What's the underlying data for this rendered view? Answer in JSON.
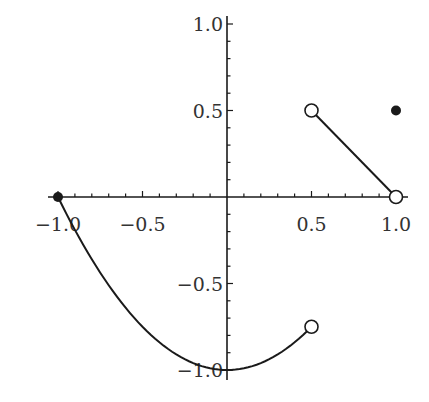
{
  "chart_data": {
    "type": "line",
    "title": "",
    "xlabel": "",
    "ylabel": "",
    "xlim": [
      -1.0,
      1.0
    ],
    "ylim": [
      -1.0,
      1.0
    ],
    "grid": false,
    "legend": null,
    "x_ticks": [
      -1.0,
      -0.5,
      0.5,
      1.0
    ],
    "x_tick_labels": [
      "−1.0",
      "−0.5",
      "0.5",
      "1.0"
    ],
    "y_ticks": [
      1.0,
      0.5,
      -0.5,
      -1.0
    ],
    "y_tick_labels": [
      "1.0",
      "0.5",
      "−0.5",
      "−1.0"
    ],
    "minor_tick_step": 0.1,
    "series": [
      {
        "name": "piece-1 (curve)",
        "description": "y = x^2 - 1 on [-1, 0.5)",
        "x": [
          -1.0,
          -0.75,
          -0.5,
          -0.25,
          0.0,
          0.25,
          0.5
        ],
        "y": [
          0.0,
          -0.4375,
          -0.75,
          -0.9375,
          -1.0,
          -0.9375,
          -0.75
        ]
      },
      {
        "name": "piece-2 (line)",
        "description": "line from (0.5, 0.5) to (1, 0)",
        "x": [
          0.5,
          1.0
        ],
        "y": [
          0.5,
          0.0
        ]
      }
    ],
    "points": [
      {
        "x": -1.0,
        "y": 0.0,
        "style": "filled"
      },
      {
        "x": 0.5,
        "y": -0.75,
        "style": "open"
      },
      {
        "x": 0.5,
        "y": 0.5,
        "style": "open"
      },
      {
        "x": 1.0,
        "y": 0.0,
        "style": "open"
      },
      {
        "x": 1.0,
        "y": 0.5,
        "style": "filled"
      }
    ],
    "colors": {
      "line": "#1a1a1a",
      "axis": "#1a1a1a",
      "text": "#333333",
      "background": "#ffffff"
    }
  }
}
